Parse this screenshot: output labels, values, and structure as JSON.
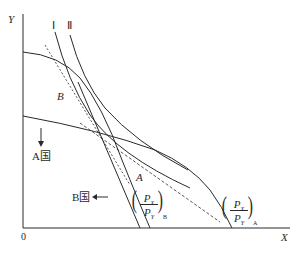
{
  "diagram": {
    "type": "economics-trade-equilibrium",
    "axes": {
      "y_label": "Y",
      "x_label": "X",
      "origin_label": "0"
    },
    "indifference_curves": [
      {
        "label": "Ⅰ"
      },
      {
        "label": "Ⅱ"
      }
    ],
    "points": [
      {
        "label": "B"
      },
      {
        "label": "A"
      }
    ],
    "countries": [
      {
        "label": "A国",
        "arrow": "down"
      },
      {
        "label": "B国",
        "arrow": "left"
      }
    ],
    "price_ratios": [
      {
        "numerator": "P",
        "numerator_sub": "X",
        "denominator": "P",
        "denominator_sub": "Y",
        "subscript": "B"
      },
      {
        "numerator": "P",
        "numerator_sub": "X",
        "denominator": "P",
        "denominator_sub": "Y",
        "subscript": "A"
      }
    ],
    "colors": {
      "line": "#2a2a2a",
      "background": "#ffffff"
    }
  }
}
